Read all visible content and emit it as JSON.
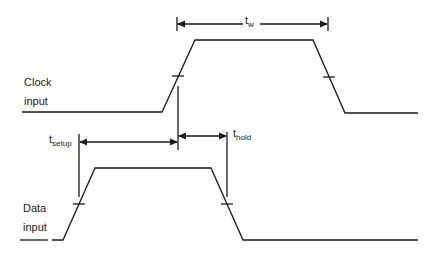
{
  "diagram": {
    "type": "timing-diagram",
    "signals": [
      {
        "name": "clock",
        "label_line1": "Clock",
        "label_line2": "input"
      },
      {
        "name": "data",
        "label_line1": "Data",
        "label_line2": "input"
      }
    ],
    "timing_labels": {
      "pulse_width": {
        "main": "t",
        "sub": "w"
      },
      "setup": {
        "main": "t",
        "sub": "setup"
      },
      "hold": {
        "main": "t",
        "sub": "hold"
      }
    },
    "colors": {
      "line": "#1a1a1a",
      "background": "#ffffff"
    }
  }
}
